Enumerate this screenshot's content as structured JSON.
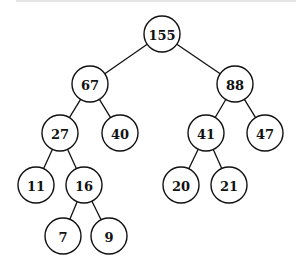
{
  "tree": {
    "root": "155",
    "nodes": [
      {
        "id": "n155",
        "label": "155",
        "x": 162,
        "y": 34
      },
      {
        "id": "n67",
        "label": "67",
        "x": 90,
        "y": 84
      },
      {
        "id": "n88",
        "label": "88",
        "x": 235,
        "y": 84
      },
      {
        "id": "n27",
        "label": "27",
        "x": 60,
        "y": 133
      },
      {
        "id": "n40",
        "label": "40",
        "x": 120,
        "y": 133
      },
      {
        "id": "n41",
        "label": "41",
        "x": 206,
        "y": 133
      },
      {
        "id": "n47",
        "label": "47",
        "x": 265,
        "y": 133
      },
      {
        "id": "n11",
        "label": "11",
        "x": 36,
        "y": 185
      },
      {
        "id": "n16",
        "label": "16",
        "x": 84,
        "y": 185
      },
      {
        "id": "n20",
        "label": "20",
        "x": 181,
        "y": 185
      },
      {
        "id": "n21",
        "label": "21",
        "x": 229,
        "y": 185
      },
      {
        "id": "n7",
        "label": "7",
        "x": 63,
        "y": 236
      },
      {
        "id": "n9",
        "label": "9",
        "x": 109,
        "y": 236
      }
    ],
    "edges": [
      [
        "n155",
        "n67"
      ],
      [
        "n155",
        "n88"
      ],
      [
        "n67",
        "n27"
      ],
      [
        "n67",
        "n40"
      ],
      [
        "n88",
        "n41"
      ],
      [
        "n88",
        "n47"
      ],
      [
        "n27",
        "n11"
      ],
      [
        "n27",
        "n16"
      ],
      [
        "n41",
        "n20"
      ],
      [
        "n41",
        "n21"
      ],
      [
        "n16",
        "n7"
      ],
      [
        "n16",
        "n9"
      ]
    ]
  }
}
